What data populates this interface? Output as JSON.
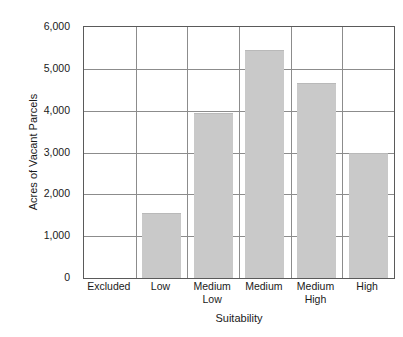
{
  "chart_data": {
    "type": "bar",
    "title": "",
    "xlabel": "Suitability",
    "ylabel": "Acres of Vacant Parcels",
    "categories": [
      "Excluded",
      "Low",
      "Medium\nLow",
      "Medium",
      "Medium\nHigh",
      "High"
    ],
    "values": [
      0,
      1550,
      3950,
      5450,
      4650,
      3000
    ],
    "ylim": [
      0,
      6000
    ],
    "yticks": [
      0,
      1000,
      2000,
      3000,
      4000,
      5000,
      6000
    ],
    "ytick_labels": [
      "0",
      "1,000",
      "2,000",
      "3,000",
      "4,000",
      "5,000",
      "6,000"
    ],
    "grid": "horizontal-and-category-dividers",
    "legend": "none",
    "bar_color": "#c9c9c9",
    "axis_color": "#5a5a5a",
    "gridline_color": "#8c8c8c",
    "background_color": "#ffffff"
  }
}
